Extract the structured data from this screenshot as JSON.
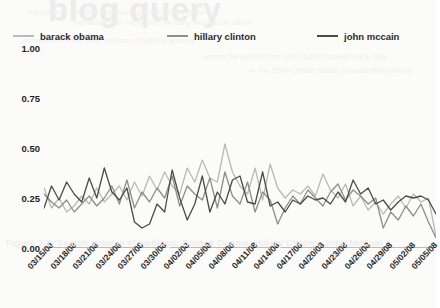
{
  "watermark": {
    "title": "blog query",
    "caption": "Figure 3.2: Search volume of weblogs: Barack Obama, Hillary Clinton, John McCain",
    "ghost_lines": [
      {
        "text": "the relative interest over time for each of the three",
        "left": 28,
        "top": 8
      },
      {
        "text": "candidates as measured by daily blog query share",
        "left": 74,
        "top": 18
      },
      {
        "text": "normalized to the total volume of political queries",
        "left": 22,
        "top": 36
      },
      {
        "text": "across the period from mid March through early May",
        "left": 202,
        "top": 52
      },
      {
        "text": "in the 2008 United States presidential primary",
        "left": 250,
        "top": 66
      }
    ]
  },
  "legend": {
    "entries": [
      {
        "label": "barack obama",
        "color": "#b9b9b9"
      },
      {
        "label": "hillary clinton",
        "color": "#8d8d8d"
      },
      {
        "label": "john mccain",
        "color": "#4a4a4a"
      }
    ]
  },
  "chart_data": {
    "type": "line",
    "title": "blog query",
    "xlabel": "",
    "ylabel": "",
    "ylim": [
      0.0,
      1.0
    ],
    "yticks": [
      0.0,
      0.25,
      0.5,
      0.75,
      1.0
    ],
    "ytick_labels": [
      "0.00",
      "0.25",
      "0.50",
      "0.75",
      "1.00"
    ],
    "grid": false,
    "legend_position": "top",
    "x_tick_labels": [
      "03/15/08",
      "03/18/08",
      "03/21/08",
      "03/24/08",
      "03/27/08",
      "03/30/08",
      "04/02/08",
      "04/05/08",
      "04/08/08",
      "04/11/08",
      "04/14/08",
      "04/17/08",
      "04/20/08",
      "04/23/08",
      "04/26/08",
      "04/29/08",
      "05/02/08",
      "05/05/08"
    ],
    "x_tick_step_days": 3,
    "x_points": 53,
    "series": [
      {
        "name": "barack obama",
        "color": "#b9b9b9",
        "values": [
          0.3,
          0.2,
          0.25,
          0.18,
          0.21,
          0.26,
          0.22,
          0.3,
          0.23,
          0.27,
          0.31,
          0.24,
          0.33,
          0.26,
          0.36,
          0.29,
          0.38,
          0.31,
          0.27,
          0.4,
          0.33,
          0.44,
          0.35,
          0.33,
          0.52,
          0.38,
          0.31,
          0.27,
          0.4,
          0.24,
          0.42,
          0.3,
          0.25,
          0.29,
          0.27,
          0.31,
          0.26,
          0.37,
          0.29,
          0.25,
          0.32,
          0.21,
          0.26,
          0.19,
          0.23,
          0.17,
          0.22,
          0.26,
          0.2,
          0.27,
          0.23,
          0.25,
          0.06
        ]
      },
      {
        "name": "hillary clinton",
        "color": "#8d8d8d",
        "values": [
          0.27,
          0.23,
          0.2,
          0.24,
          0.18,
          0.22,
          0.26,
          0.21,
          0.25,
          0.31,
          0.22,
          0.34,
          0.2,
          0.28,
          0.23,
          0.3,
          0.25,
          0.36,
          0.21,
          0.31,
          0.27,
          0.24,
          0.35,
          0.2,
          0.38,
          0.26,
          0.22,
          0.33,
          0.18,
          0.28,
          0.24,
          0.12,
          0.2,
          0.26,
          0.22,
          0.29,
          0.25,
          0.21,
          0.28,
          0.32,
          0.24,
          0.29,
          0.26,
          0.22,
          0.25,
          0.1,
          0.18,
          0.14,
          0.21,
          0.16,
          0.22,
          0.13,
          0.05
        ]
      },
      {
        "name": "john mccain",
        "color": "#4a4a4a",
        "values": [
          0.2,
          0.31,
          0.24,
          0.33,
          0.27,
          0.23,
          0.35,
          0.25,
          0.4,
          0.28,
          0.24,
          0.3,
          0.13,
          0.1,
          0.12,
          0.22,
          0.18,
          0.39,
          0.25,
          0.14,
          0.22,
          0.36,
          0.18,
          0.28,
          0.22,
          0.34,
          0.36,
          0.23,
          0.22,
          0.38,
          0.21,
          0.23,
          0.18,
          0.24,
          0.22,
          0.26,
          0.24,
          0.25,
          0.22,
          0.28,
          0.23,
          0.34,
          0.27,
          0.3,
          0.22,
          0.24,
          0.19,
          0.23,
          0.26,
          0.25,
          0.26,
          0.24,
          0.17
        ]
      }
    ]
  }
}
